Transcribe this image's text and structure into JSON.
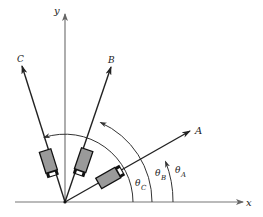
{
  "diagram": {
    "axes": {
      "x_label": "x",
      "y_label": "y"
    },
    "vectors": [
      {
        "id": "A",
        "label": "A",
        "angle_label": "θ",
        "angle_subscript": "A"
      },
      {
        "id": "B",
        "label": "B",
        "angle_label": "θ",
        "angle_subscript": "B"
      },
      {
        "id": "C",
        "label": "C",
        "angle_label": "θ",
        "angle_subscript": "C"
      }
    ],
    "colors": {
      "axis": "#777777",
      "vector": "#222222",
      "arc": "#333333",
      "detector_fill": "#9a9a9a",
      "detector_stroke": "#111111"
    }
  }
}
